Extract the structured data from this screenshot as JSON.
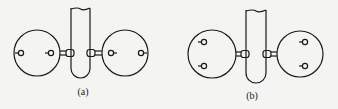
{
  "figure": {
    "panels": [
      {
        "id": "a",
        "label": "(a)",
        "label_pos": [
          83,
          92
        ],
        "tube": {
          "x1": 71,
          "x2": 90,
          "top": 8,
          "bottom": 78
        },
        "connector_y": 53,
        "left_disc": {
          "cx": 37,
          "cy": 53,
          "r": 23,
          "electrodes": [
            {
              "x": 21,
              "y": 53,
              "side": "left"
            },
            {
              "x": 51,
              "y": 53,
              "side": "left"
            }
          ]
        },
        "right_disc": {
          "cx": 125,
          "cy": 53,
          "r": 23,
          "electrodes": [
            {
              "x": 111,
              "y": 53,
              "side": "right"
            },
            {
              "x": 141,
              "y": 53,
              "side": "right"
            }
          ]
        },
        "electrode_arrangement": "horizontal (along axis)"
      },
      {
        "id": "b",
        "label": "(b)",
        "label_pos": [
          252,
          96
        ],
        "tube": {
          "x1": 246,
          "x2": 266,
          "top": 10,
          "bottom": 83
        },
        "connector_y": 54,
        "left_disc": {
          "cx": 212,
          "cy": 54,
          "r": 24,
          "electrodes": [
            {
              "x": 204,
              "y": 42,
              "side": "left"
            },
            {
              "x": 204,
              "y": 66,
              "side": "left"
            }
          ]
        },
        "right_disc": {
          "cx": 300,
          "cy": 54,
          "r": 23,
          "electrodes": [
            {
              "x": 305,
              "y": 42,
              "side": "left"
            },
            {
              "x": 305,
              "y": 66,
              "side": "left"
            }
          ]
        },
        "electrode_arrangement": "vertical (perpendicular to axis)"
      }
    ],
    "colors": {
      "line": "#1a1a1a",
      "background": "#f4f4f2"
    }
  }
}
